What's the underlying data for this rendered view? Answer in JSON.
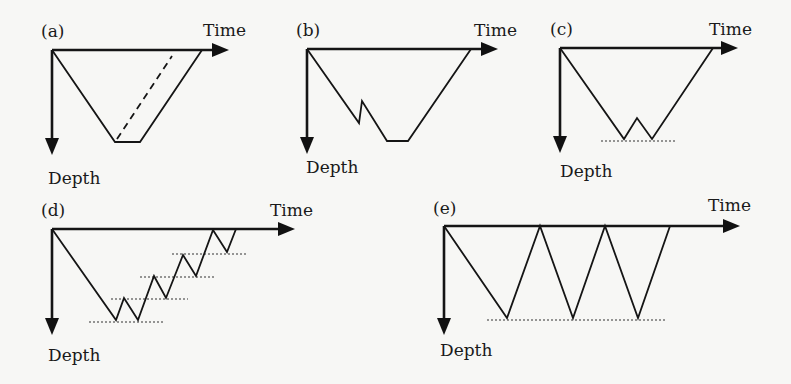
{
  "figure": {
    "axis_labels": {
      "x": "Time",
      "y": "Depth"
    },
    "panels": [
      {
        "id": "a",
        "label": "(a)",
        "description": "Square dive profile with dashed alternative ascent line",
        "has_dashed_line": true,
        "reference_lines": 0
      },
      {
        "id": "b",
        "label": "(b)",
        "description": "Dive profile with a reverse step (ascent then re-descent) before bottom",
        "has_dashed_line": false,
        "reference_lines": 0
      },
      {
        "id": "c",
        "label": "(c)",
        "description": "Dive profile with a W-shaped bottom touching a reference depth line",
        "has_dashed_line": false,
        "reference_lines": 1
      },
      {
        "id": "d",
        "label": "(d)",
        "description": "Repeated saw-tooth ascent with stepped reference depth lines",
        "has_dashed_line": false,
        "reference_lines": 4
      },
      {
        "id": "e",
        "label": "(e)",
        "description": "Multiple repetitive bounce dives to the same depth",
        "has_dashed_line": false,
        "reference_lines": 1
      }
    ]
  }
}
